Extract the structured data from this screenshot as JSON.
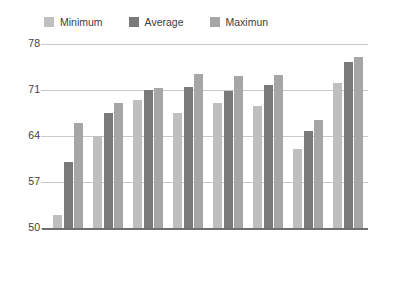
{
  "chart_data": {
    "type": "bar",
    "title": "",
    "subtitle": "",
    "xlabel": "",
    "ylabel": "",
    "ylim": [
      50,
      78
    ],
    "yticks": [
      50,
      57,
      64,
      71,
      78
    ],
    "grid": true,
    "legend_position": "top-left",
    "categories": [
      "Naive Bayes",
      "Logistic",
      "M. Perceptron",
      "R. Committee",
      "LMT",
      "R. Forest",
      "R. Tree",
      "SVM"
    ],
    "series": [
      {
        "name": "Minimum",
        "color": "#bfbfbf",
        "values": [
          52.0,
          64.0,
          69.5,
          67.5,
          69.0,
          68.5,
          62.0,
          72.0
        ]
      },
      {
        "name": "Average",
        "color": "#7a7a7a",
        "values": [
          60.0,
          67.5,
          71.0,
          71.5,
          70.8,
          71.7,
          64.8,
          75.2
        ]
      },
      {
        "name": "Maximun",
        "color": "#a6a6a6",
        "values": [
          66.0,
          69.0,
          71.3,
          73.5,
          73.2,
          73.3,
          66.5,
          76.0
        ]
      }
    ]
  },
  "legend": {
    "items": [
      {
        "label": "Minimum",
        "color": "#bfbfbf"
      },
      {
        "label": "Average",
        "color": "#7a7a7a"
      },
      {
        "label": "Maximun",
        "color": "#a6a6a6"
      }
    ]
  },
  "axes": {
    "y_tick_labels": [
      "78",
      "71",
      "64",
      "57",
      "50"
    ],
    "x_tick_labels": [
      "Naive Bayes",
      "Logistic",
      "M. Perceptron",
      "R. Committee",
      "LMT",
      "R. Forest",
      "R. Tree",
      "SVM"
    ]
  },
  "colors": {
    "gridline": "#c9c9c9",
    "axis": "#6f6f6f",
    "text": "#3d3d3d",
    "background": "#ffffff"
  }
}
